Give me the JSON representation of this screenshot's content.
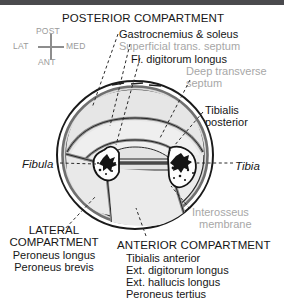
{
  "figure": {
    "type": "anatomical-cross-section",
    "region": "leg (lower limb) transverse section at mid-calf",
    "title": "POSTERIOR COMPARTMENT"
  },
  "orientation": {
    "name": "orientation-compass",
    "top": "POST",
    "bottom": "ANT",
    "left": "LAT",
    "right": "MED"
  },
  "posterior": {
    "heading": "POSTERIOR COMPARTMENT",
    "items": [
      {
        "text": "Gastrocnemius & soleus",
        "style": "dark"
      },
      {
        "text": "Superficial trans. septum",
        "style": "gray"
      },
      {
        "text": "Fl. digitorum longus",
        "style": "dark"
      },
      {
        "text": "Deep transverse",
        "style": "gray"
      },
      {
        "text": "septum",
        "style": "gray"
      }
    ]
  },
  "right_labels": {
    "tibialis_posterior_line1": "Tibialis",
    "tibialis_posterior_line2": "posterior",
    "tibia": "Tibia",
    "interosseus_line1": "Interosseus",
    "interosseus_line2": "membrane"
  },
  "left_labels": {
    "fibula": "Fibula"
  },
  "lateral": {
    "heading_line1": "LATERAL",
    "heading_line2": "COMPARTMENT",
    "items": [
      "Peroneus longus",
      "Peroneus brevis"
    ]
  },
  "anterior": {
    "heading": "ANTERIOR COMPARTMENT",
    "items": [
      "Tibialis anterior",
      "Ext. digitorum longus",
      "Ext. hallucis longus",
      "Peroneus tertius"
    ]
  },
  "colors": {
    "background": "#ffffff",
    "topbar": "#4a4a4d",
    "text_dark": "#161616",
    "text_gray": "#a7a7a7",
    "outline": "#1a1a1a",
    "skin_fill": "#d9d9d9",
    "muscle_fill": "#e8e8e8",
    "bone_fill": "#fdfdfd",
    "septum": "#8a8a8a"
  }
}
